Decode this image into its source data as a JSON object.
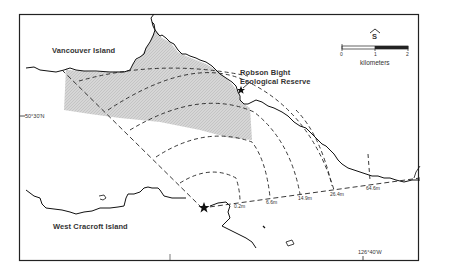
{
  "map": {
    "places": {
      "vancouver_island": "Vancouver Island",
      "robson_bight_line1": "Robson Bight",
      "robson_bight_line2": "Ecological Reserve",
      "west_cracroft": "West Cracroft Island"
    },
    "coordinates": {
      "latitude": "50°30'N",
      "longitude": "126°40'W"
    },
    "north_arrow": {
      "symbol": "^",
      "label": "S"
    },
    "scale_bar": {
      "ticks": [
        "0",
        "1",
        "2"
      ],
      "unit": "kilometers"
    },
    "distance_labels": [
      "0.2m",
      "6.6m",
      "14.9m",
      "26.4m",
      "64.6m"
    ],
    "colors": {
      "coast": "#111111",
      "shading": "#cfcfcf",
      "frame": "#222222",
      "background": "#ffffff"
    }
  }
}
